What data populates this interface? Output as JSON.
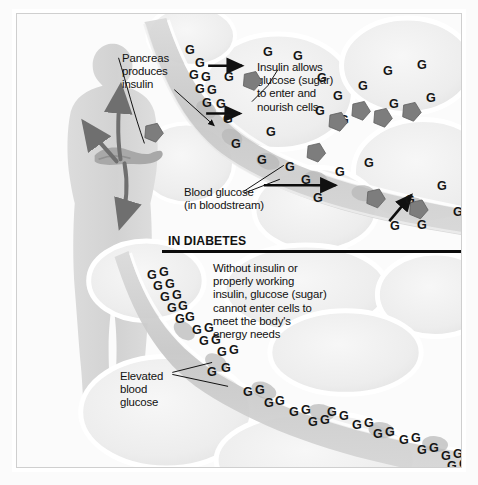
{
  "diagram": {
    "section_heading": "IN DIABETES",
    "labels": {
      "pancreas": "Pancreas\nproduces\ninsulin",
      "insulin_allows": "Insulin allows\nglucose (sugar)\nto enter and\nnourish cells",
      "blood_glucose": "Blood glucose\n(in bloodstream)",
      "without_insulin": "Without insulin or\nproperly working\ninsulin, glucose (sugar)\ncannot enter cells to\nmeet the body's\nenergy needs",
      "elevated": "Elevated\nblood\nglucose"
    },
    "glucose_symbol": "G",
    "colors": {
      "text": "#111111",
      "insulin_molecule": "#7d7d7d",
      "arrow": "#6f6f6f",
      "body_silhouette": "#d9d9d9",
      "vessel": "#cfcfcf",
      "cell_fill": "#f2f2f2",
      "divider": "#0b0b0b",
      "frame": "#cfcfcf"
    },
    "normal_section": {
      "glucose_positions": [
        {
          "x": 168,
          "y": 30
        },
        {
          "x": 178,
          "y": 43
        },
        {
          "x": 172,
          "y": 55
        },
        {
          "x": 184,
          "y": 57
        },
        {
          "x": 178,
          "y": 69
        },
        {
          "x": 190,
          "y": 70
        },
        {
          "x": 185,
          "y": 83
        },
        {
          "x": 199,
          "y": 84
        },
        {
          "x": 207,
          "y": 57
        },
        {
          "x": 206,
          "y": 99
        },
        {
          "x": 214,
          "y": 124
        },
        {
          "x": 246,
          "y": 32
        },
        {
          "x": 276,
          "y": 36
        },
        {
          "x": 300,
          "y": 58
        },
        {
          "x": 316,
          "y": 76
        },
        {
          "x": 298,
          "y": 91
        },
        {
          "x": 322,
          "y": 100
        },
        {
          "x": 341,
          "y": 66
        },
        {
          "x": 366,
          "y": 51
        },
        {
          "x": 400,
          "y": 45
        },
        {
          "x": 372,
          "y": 84
        },
        {
          "x": 409,
          "y": 78
        },
        {
          "x": 249,
          "y": 112
        },
        {
          "x": 240,
          "y": 140
        },
        {
          "x": 268,
          "y": 147
        },
        {
          "x": 284,
          "y": 160
        },
        {
          "x": 296,
          "y": 178
        },
        {
          "x": 318,
          "y": 152
        },
        {
          "x": 347,
          "y": 143
        },
        {
          "x": 388,
          "y": 180
        },
        {
          "x": 400,
          "y": 205
        },
        {
          "x": 373,
          "y": 206
        },
        {
          "x": 420,
          "y": 166
        },
        {
          "x": 436,
          "y": 192
        }
      ],
      "insulin_positions": [
        {
          "x": 137,
          "y": 119
        },
        {
          "x": 236,
          "y": 67
        },
        {
          "x": 300,
          "y": 139
        },
        {
          "x": 322,
          "y": 108
        },
        {
          "x": 345,
          "y": 97
        },
        {
          "x": 367,
          "y": 104
        },
        {
          "x": 396,
          "y": 98
        },
        {
          "x": 360,
          "y": 185
        },
        {
          "x": 403,
          "y": 196
        }
      ]
    },
    "diabetes_section": {
      "glucose_positions": [
        {
          "x": 130,
          "y": 255
        },
        {
          "x": 142,
          "y": 252
        },
        {
          "x": 136,
          "y": 266
        },
        {
          "x": 148,
          "y": 264
        },
        {
          "x": 143,
          "y": 277
        },
        {
          "x": 155,
          "y": 275
        },
        {
          "x": 150,
          "y": 288
        },
        {
          "x": 161,
          "y": 286
        },
        {
          "x": 158,
          "y": 299
        },
        {
          "x": 168,
          "y": 297
        },
        {
          "x": 175,
          "y": 310
        },
        {
          "x": 187,
          "y": 308
        },
        {
          "x": 182,
          "y": 321
        },
        {
          "x": 194,
          "y": 320
        },
        {
          "x": 200,
          "y": 332
        },
        {
          "x": 212,
          "y": 330
        },
        {
          "x": 226,
          "y": 372
        },
        {
          "x": 238,
          "y": 370
        },
        {
          "x": 247,
          "y": 383
        },
        {
          "x": 258,
          "y": 381
        },
        {
          "x": 272,
          "y": 392
        },
        {
          "x": 284,
          "y": 390
        },
        {
          "x": 291,
          "y": 402
        },
        {
          "x": 303,
          "y": 400
        },
        {
          "x": 310,
          "y": 392
        },
        {
          "x": 322,
          "y": 396
        },
        {
          "x": 335,
          "y": 405
        },
        {
          "x": 347,
          "y": 403
        },
        {
          "x": 356,
          "y": 414
        },
        {
          "x": 368,
          "y": 412
        },
        {
          "x": 382,
          "y": 420
        },
        {
          "x": 394,
          "y": 418
        },
        {
          "x": 400,
          "y": 430
        },
        {
          "x": 412,
          "y": 428
        },
        {
          "x": 424,
          "y": 436
        },
        {
          "x": 436,
          "y": 434
        },
        {
          "x": 430,
          "y": 446
        },
        {
          "x": 442,
          "y": 444
        },
        {
          "x": 190,
          "y": 352
        },
        {
          "x": 204,
          "y": 348
        }
      ]
    }
  }
}
